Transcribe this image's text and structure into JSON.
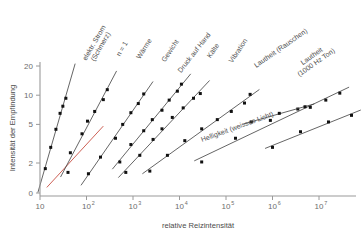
{
  "chart_data": {
    "type": "line",
    "title": "",
    "xlabel": "relative Reizintensität",
    "ylabel": "Intensität der Empfindung",
    "xscale": "log",
    "yscale": "log",
    "xlim": [
      10,
      30000000
    ],
    "ylim": [
      1,
      22
    ],
    "grid": false,
    "legend": "inline-curve-labels",
    "xticks": [
      {
        "value": 10,
        "label": "10",
        "base": "10",
        "exp": ""
      },
      {
        "value": 100,
        "label": "10^2",
        "base": "10",
        "exp": "2"
      },
      {
        "value": 1000,
        "label": "10^3",
        "base": "10",
        "exp": "3"
      },
      {
        "value": 10000,
        "label": "10^4",
        "base": "10",
        "exp": "4"
      },
      {
        "value": 100000,
        "label": "10^5",
        "base": "10",
        "exp": "5"
      },
      {
        "value": 1000000,
        "label": "10^6",
        "base": "10",
        "exp": "6"
      },
      {
        "value": 10000000,
        "label": "10^7",
        "base": "10",
        "exp": "7"
      }
    ],
    "yticks": [
      {
        "value": 0,
        "label": "0"
      },
      {
        "value": 2,
        "label": "2"
      },
      {
        "value": 5,
        "label": "5"
      },
      {
        "value": 10,
        "label": "10"
      },
      {
        "value": 20,
        "label": "20"
      }
    ],
    "accent_color": "#c0392b",
    "line_color": "#3d3d3d",
    "point_color": "#111111",
    "series": [
      {
        "name": "elektr. Strom (Schmerz)",
        "label": "elektr. Strom\n(Schmerz)",
        "label_line1": "elektr. Strom",
        "label_line2": "(Schmerz)",
        "exponent_n": 3.5,
        "color": "#3d3d3d",
        "is_reference": false,
        "points": [
          {
            "x": 13,
            "y": 1.75
          },
          {
            "x": 17,
            "y": 2.9
          },
          {
            "x": 22,
            "y": 4.45
          },
          {
            "x": 27,
            "y": 6.5
          },
          {
            "x": 31,
            "y": 7.7
          },
          {
            "x": 36,
            "y": 9.3
          }
        ]
      },
      {
        "name": "n = 1",
        "label_line1": "n = 1",
        "label_line2": "",
        "exponent_n": 1.0,
        "color": "#c0392b",
        "is_reference": true,
        "points": []
      },
      {
        "name": "Wärme",
        "label_line1": "Wärme",
        "label_line2": "",
        "exponent_n": 1.6,
        "color": "#3d3d3d",
        "is_reference": false,
        "points": [
          {
            "x": 40,
            "y": 1.6
          },
          {
            "x": 45,
            "y": 2.55
          },
          {
            "x": 80,
            "y": 4.0
          },
          {
            "x": 105,
            "y": 5.4
          },
          {
            "x": 150,
            "y": 6.8
          },
          {
            "x": 230,
            "y": 9.0
          },
          {
            "x": 280,
            "y": 11.4
          }
        ]
      },
      {
        "name": "Gewicht",
        "label_line1": "Gewicht",
        "label_line2": "",
        "exponent_n": 1.45,
        "color": "#3d3d3d",
        "is_reference": false,
        "points": [
          {
            "x": 110,
            "y": 1.55
          },
          {
            "x": 200,
            "y": 2.3
          },
          {
            "x": 420,
            "y": 3.6
          },
          {
            "x": 600,
            "y": 5.0
          },
          {
            "x": 900,
            "y": 6.6
          },
          {
            "x": 1300,
            "y": 8.2
          },
          {
            "x": 1700,
            "y": 10.3
          }
        ]
      },
      {
        "name": "Druck auf Hand",
        "label_line1": "Druck auf Hand",
        "label_line2": "",
        "exponent_n": 1.1,
        "color": "#3d3d3d",
        "is_reference": false,
        "points": [
          {
            "x": 520,
            "y": 2.05
          },
          {
            "x": 900,
            "y": 3.1
          },
          {
            "x": 1700,
            "y": 4.3
          },
          {
            "x": 2600,
            "y": 5.6
          },
          {
            "x": 4200,
            "y": 7.0
          },
          {
            "x": 6000,
            "y": 8.9
          },
          {
            "x": 9000,
            "y": 11.0
          },
          {
            "x": 11000,
            "y": 13.0
          }
        ]
      },
      {
        "name": "Kälte",
        "label_line1": "Kälte",
        "label_line2": "",
        "exponent_n": 1.0,
        "color": "#3d3d3d",
        "is_reference": false,
        "points": [
          {
            "x": 700,
            "y": 1.6
          },
          {
            "x": 1400,
            "y": 2.4
          },
          {
            "x": 2700,
            "y": 3.5
          },
          {
            "x": 4200,
            "y": 4.5
          },
          {
            "x": 7000,
            "y": 5.9
          },
          {
            "x": 12000,
            "y": 7.4
          },
          {
            "x": 20000,
            "y": 9.3
          },
          {
            "x": 28000,
            "y": 10.4
          }
        ]
      },
      {
        "name": "Vibration",
        "label_line1": "Vibration",
        "label_line2": "",
        "exponent_n": 0.95,
        "color": "#3d3d3d",
        "is_reference": false,
        "points": [
          {
            "x": 2300,
            "y": 1.65
          },
          {
            "x": 5500,
            "y": 2.4
          },
          {
            "x": 13000,
            "y": 3.4
          },
          {
            "x": 30000,
            "y": 4.5
          },
          {
            "x": 65000,
            "y": 5.6
          },
          {
            "x": 130000,
            "y": 6.8
          },
          {
            "x": 250000,
            "y": 8.3
          },
          {
            "x": 330000,
            "y": 10.2
          }
        ]
      },
      {
        "name": "Lautheit (Rauschen)",
        "label_line1": "Lautheit (Rauschen)",
        "label_line2": "",
        "exponent_n": 0.6,
        "color": "#3d3d3d",
        "is_reference": false,
        "points": [
          {
            "x": 30000,
            "y": 2.05
          },
          {
            "x": 160000,
            "y": 3.6
          },
          {
            "x": 900000,
            "y": 5.5
          },
          {
            "x": 3500000,
            "y": 7.2
          },
          {
            "x": 6500000,
            "y": 7.5
          },
          {
            "x": 14000000,
            "y": 8.9
          },
          {
            "x": 28000000,
            "y": 10.5
          }
        ]
      },
      {
        "name": "Lautheit (1000 Hz Ton)",
        "label_line1": "Lautheit",
        "label_line2": "(1000 Hz Ton)",
        "exponent_n": 0.55,
        "color": "#3d3d3d",
        "is_reference": false,
        "points": [
          {
            "x": 1000000,
            "y": 2.9
          },
          {
            "x": 4000000,
            "y": 4.2
          },
          {
            "x": 16000000,
            "y": 5.3
          },
          {
            "x": 50000000,
            "y": 6.2
          }
        ]
      },
      {
        "name": "Helligkeit (weisses Licht)",
        "label_line1": "Helligkeit (weisses Licht)",
        "label_line2": "",
        "exponent_n": 0.33,
        "color": "#3d3d3d",
        "is_reference": false,
        "points": [
          {
            "x": 350000,
            "y": 5.3
          },
          {
            "x": 1400000,
            "y": 6.5
          },
          {
            "x": 5000000,
            "y": 7.6
          }
        ]
      }
    ]
  },
  "axes": {
    "x_title": "relative Reizintensität",
    "y_title": "Intensität der Empfindung"
  },
  "curve_labels": [
    {
      "id": "elektr-strom",
      "line1": "elektr. Strom",
      "line2": "(Schmerz)",
      "x": 96,
      "y": 44,
      "rot": -60
    },
    {
      "id": "n-gleich-1",
      "line1": "n = 1",
      "line2": "",
      "x": 124,
      "y": 50,
      "rot": -60
    },
    {
      "id": "waerme",
      "line1": "Wärme",
      "line2": "",
      "x": 146,
      "y": 50,
      "rot": -58
    },
    {
      "id": "gewicht",
      "line1": "Gewicht",
      "line2": "",
      "x": 172,
      "y": 52,
      "rot": -56
    },
    {
      "id": "druck-auf-hand",
      "line1": "Druck auf Hand",
      "line2": "",
      "x": 196,
      "y": 54,
      "rot": -52
    },
    {
      "id": "kaelte",
      "line1": "Kälte",
      "line2": "",
      "x": 215,
      "y": 52,
      "rot": -56
    },
    {
      "id": "vibration",
      "line1": "Vibration",
      "line2": "",
      "x": 240,
      "y": 52,
      "rot": -56
    },
    {
      "id": "lautheit-rauschen",
      "line1": "Lautheit (Rauschen)",
      "line2": "",
      "x": 282,
      "y": 50,
      "rot": -35
    },
    {
      "id": "lautheit-1000hz",
      "line1": "Lautheit",
      "line2": "(1000 Hz Ton)",
      "x": 313,
      "y": 58,
      "rot": -35
    },
    {
      "id": "helligkeit",
      "line1": "Helligkeit (weisses Licht)",
      "line2": "",
      "x": 238,
      "y": 129,
      "rot": -20
    }
  ]
}
